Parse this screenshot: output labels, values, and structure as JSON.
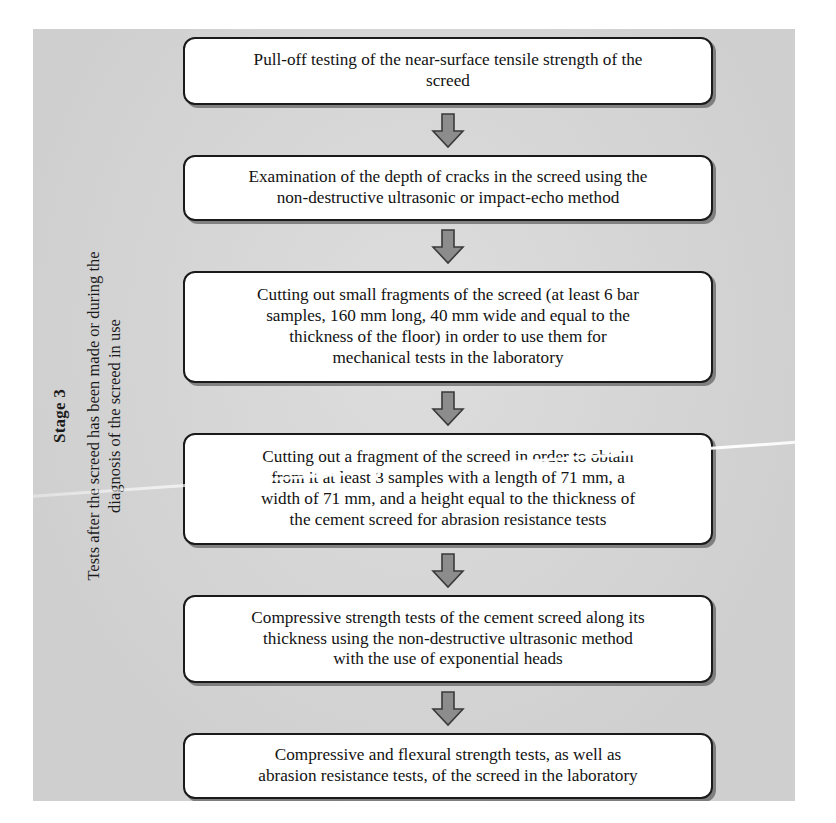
{
  "diagram": {
    "type": "flowchart",
    "orientation": "vertical-top-down",
    "stage": {
      "title": "Stage 3",
      "description_line_1": "Tests after the screed has been made or during the",
      "description_line_2": "diagnosis of the screed in use"
    },
    "colors": {
      "paper_background": "#d6d6d6",
      "node_fill": "#ffffff",
      "node_border": "#1a1a1a",
      "arrow_fill": "#8c8c8c",
      "arrow_border": "#3a3a3a",
      "text": "#121212"
    },
    "nodes": [
      {
        "id": "node-1",
        "text": "Pull-off testing of the near-surface tensile strength of the\nscreed"
      },
      {
        "id": "node-2",
        "text": "Examination of the depth of cracks in the screed using the\nnon-destructive ultrasonic or impact-echo method"
      },
      {
        "id": "node-3",
        "text": "Cutting out small fragments of the screed (at least 6 bar\nsamples, 160 mm long, 40 mm wide and equal to the\nthickness of the floor) in order to use them for\nmechanical tests in the laboratory"
      },
      {
        "id": "node-4",
        "text": "Cutting out a fragment of the screed in order to obtain\nfrom it at least 3 samples with a length of 71 mm, a\nwidth of 71 mm, and a height equal to the thickness of\nthe cement screed for abrasion resistance tests"
      },
      {
        "id": "node-5",
        "text": "Compressive strength tests of the cement screed along its\nthickness using the non-destructive ultrasonic method\nwith the use of exponential heads"
      },
      {
        "id": "node-6",
        "text": "Compressive and flexural strength tests, as well as\nabrasion resistance tests, of the screed in the laboratory"
      }
    ],
    "connectors": [
      {
        "id": "arrow-1",
        "from": "node-1",
        "to": "node-2",
        "shape": "down-block-arrow"
      },
      {
        "id": "arrow-2",
        "from": "node-2",
        "to": "node-3",
        "shape": "down-block-arrow"
      },
      {
        "id": "arrow-3",
        "from": "node-3",
        "to": "node-4",
        "shape": "down-block-arrow"
      },
      {
        "id": "arrow-4",
        "from": "node-4",
        "to": "node-5",
        "shape": "down-block-arrow"
      },
      {
        "id": "arrow-5",
        "from": "node-5",
        "to": "node-6",
        "shape": "down-block-arrow"
      }
    ]
  }
}
